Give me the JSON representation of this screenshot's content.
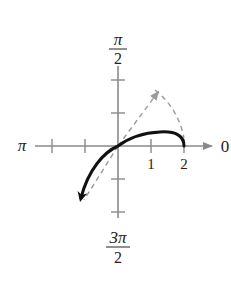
{
  "diagram": {
    "type": "polar-graph",
    "axis_labels": {
      "top_numerator": "π",
      "top_denominator": "2",
      "left": "π",
      "right": "0",
      "bottom_numerator": "3π",
      "bottom_denominator": "2"
    },
    "tick_labels": [
      "1",
      "2"
    ],
    "colors": {
      "axis": "#8a8a8a",
      "curve": "#111111",
      "dashed": "#9a9a9a",
      "text": "#222222"
    },
    "curves": [
      {
        "name": "solid-curve",
        "style": "solid",
        "description": "Arc from r=2 on polar axis, rising above axis, through pole, ending with arrow in third quadrant"
      },
      {
        "name": "dashed-path",
        "style": "dashed",
        "description": "Dashed line from pole to upper-right point with arrowhead, then dashed arc down to r=2 on polar axis"
      }
    ]
  }
}
